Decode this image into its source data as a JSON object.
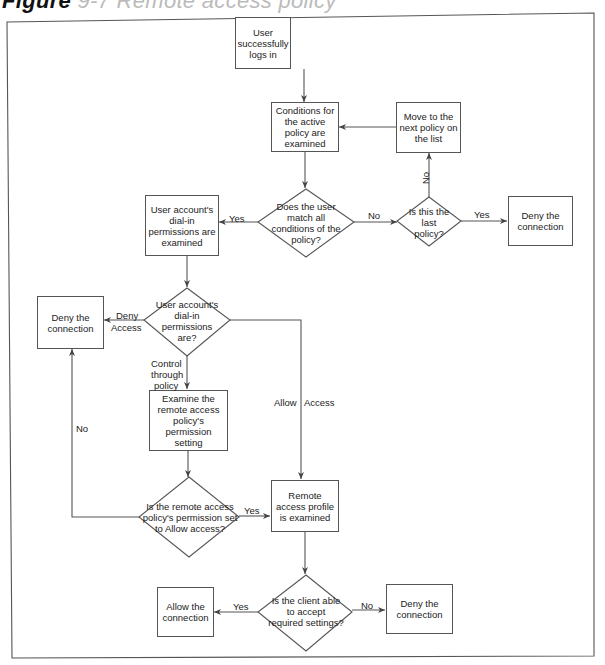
{
  "figure": {
    "title": "Figure",
    "title_rest": " 9-7  Remote access policy",
    "frame_color": "#555555"
  },
  "nodes": {
    "start": "User successfully logs in",
    "conditions": "Conditions for the active policy are examined",
    "next_policy": "Move to the next policy on the list",
    "match_decision": "Does the user match all conditions of the policy?",
    "last_policy_decision": "Is this the last policy?",
    "deny_top": "Deny the connection",
    "dialin_examined": "User account's dial-in permissions are examined",
    "dialin_decision": "User account's dial-in permissions are?",
    "deny_left": "Deny the connection",
    "examine_ra_policy": "Examine the remote access policy's permission setting",
    "ra_permission_decision": "Is the remote access policy's permission set to Allow access?",
    "profile_examined": "Remote access profile is examined",
    "client_decision": "Is the client able to accept required settings?",
    "allow_final": "Allow the connection",
    "deny_final": "Deny the connection"
  },
  "edges": {
    "match_yes": "Yes",
    "match_no": "No",
    "last_yes": "Yes",
    "last_no": "No",
    "deny_access_1": "Deny",
    "deny_access_2": "Access",
    "control_1": "Control",
    "control_2": "through",
    "control_3": "policy",
    "allow_access_1": "Allow",
    "allow_access_2": "Access",
    "ra_no": "No",
    "ra_yes": "Yes",
    "client_yes": "Yes",
    "client_no": "No"
  }
}
